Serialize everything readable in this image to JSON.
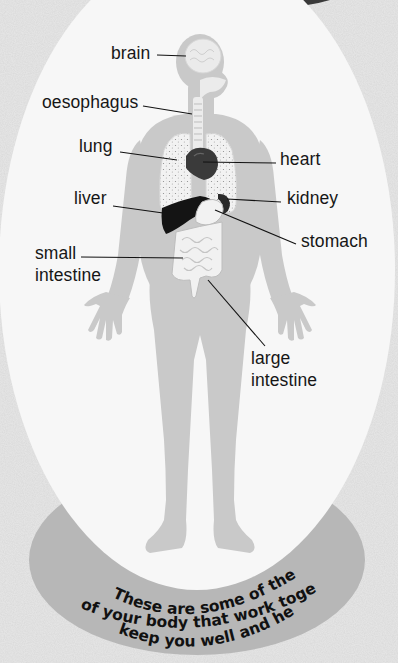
{
  "diagram": {
    "colors": {
      "background": "#e4e4e4",
      "oval": "#f7f7f7",
      "band": "#b7b7b7",
      "body": "#c9c9c9",
      "organ_dark": "#222222",
      "label_text": "#161616",
      "corner_shape": "#3a3a3a"
    },
    "labels": {
      "brain": "brain",
      "oesophagus": "oesophagus",
      "lung": "lung",
      "heart": "heart",
      "liver": "liver",
      "kidney": "kidney",
      "stomach": "stomach",
      "small_intestine_1": "small",
      "small_intestine_2": "intestine",
      "large_intestine_1": "large",
      "large_intestine_2": "intestine"
    },
    "caption": {
      "line1": "These are some of the many parts",
      "line2": "of your body that work together to",
      "line3": "keep you well and healthy."
    }
  }
}
